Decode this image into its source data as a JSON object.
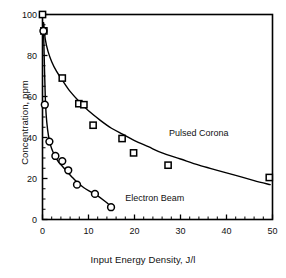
{
  "chart_data": {
    "type": "scatter",
    "title": "",
    "xlabel": "Input Energy Density, J/l",
    "ylabel": "Concentration, ppm",
    "xlim": [
      0,
      50
    ],
    "ylim": [
      0,
      100
    ],
    "xticks": [
      0,
      10,
      20,
      30,
      40,
      50
    ],
    "yticks": [
      0,
      20,
      40,
      60,
      80,
      100
    ],
    "xtick_labels": [
      "0",
      "10",
      "20",
      "30",
      "40",
      "50"
    ],
    "ytick_labels": [
      "0",
      "20",
      "40",
      "60",
      "80",
      "100"
    ],
    "minor_ticks": true,
    "grid": false,
    "legend": "inline-annotations",
    "frame": "box",
    "series": [
      {
        "name": "Pulsed Corona",
        "marker": "open-square",
        "label_x": 27.5,
        "label_y": 41.5,
        "points": [
          {
            "x": 0.0,
            "y": 100.0
          },
          {
            "x": 0.3,
            "y": 92.0
          },
          {
            "x": 4.3,
            "y": 69.0
          },
          {
            "x": 7.9,
            "y": 56.5
          },
          {
            "x": 9.0,
            "y": 56.0
          },
          {
            "x": 11.0,
            "y": 46.0
          },
          {
            "x": 17.3,
            "y": 39.5
          },
          {
            "x": 19.8,
            "y": 32.5
          },
          {
            "x": 27.3,
            "y": 26.5
          },
          {
            "x": 49.3,
            "y": 20.5
          }
        ],
        "curve": [
          {
            "x": 0.25,
            "y": 96.0
          },
          {
            "x": 0.6,
            "y": 88.0
          },
          {
            "x": 1.2,
            "y": 82.0
          },
          {
            "x": 2.0,
            "y": 77.0
          },
          {
            "x": 3.0,
            "y": 72.5
          },
          {
            "x": 4.3,
            "y": 68.0
          },
          {
            "x": 6.0,
            "y": 62.5
          },
          {
            "x": 8.0,
            "y": 57.5
          },
          {
            "x": 10.0,
            "y": 53.0
          },
          {
            "x": 12.5,
            "y": 48.5
          },
          {
            "x": 15.0,
            "y": 44.5
          },
          {
            "x": 17.5,
            "y": 41.5
          },
          {
            "x": 20.0,
            "y": 38.5
          },
          {
            "x": 23.0,
            "y": 35.5
          },
          {
            "x": 26.0,
            "y": 32.5
          },
          {
            "x": 30.0,
            "y": 29.5
          },
          {
            "x": 34.0,
            "y": 26.5
          },
          {
            "x": 38.0,
            "y": 24.0
          },
          {
            "x": 42.0,
            "y": 21.5
          },
          {
            "x": 46.0,
            "y": 19.0
          },
          {
            "x": 49.5,
            "y": 17.0
          }
        ]
      },
      {
        "name": "Electron Beam",
        "marker": "open-circle",
        "label_x": 18.0,
        "label_y": 10.0,
        "points": [
          {
            "x": 0.2,
            "y": 92.0
          },
          {
            "x": 0.5,
            "y": 56.0
          },
          {
            "x": 1.5,
            "y": 38.0
          },
          {
            "x": 2.8,
            "y": 31.0
          },
          {
            "x": 4.3,
            "y": 28.5
          },
          {
            "x": 5.6,
            "y": 24.0
          },
          {
            "x": 7.5,
            "y": 17.0
          },
          {
            "x": 11.4,
            "y": 12.5
          },
          {
            "x": 14.9,
            "y": 6.0
          }
        ],
        "curve": [
          {
            "x": 0.15,
            "y": 96.0
          },
          {
            "x": 0.3,
            "y": 86.0
          },
          {
            "x": 0.45,
            "y": 72.0
          },
          {
            "x": 0.6,
            "y": 60.0
          },
          {
            "x": 0.8,
            "y": 51.0
          },
          {
            "x": 1.1,
            "y": 44.0
          },
          {
            "x": 1.5,
            "y": 38.5
          },
          {
            "x": 2.0,
            "y": 34.5
          },
          {
            "x": 2.7,
            "y": 31.0
          },
          {
            "x": 3.5,
            "y": 28.0
          },
          {
            "x": 4.5,
            "y": 25.5
          },
          {
            "x": 5.5,
            "y": 23.0
          },
          {
            "x": 6.5,
            "y": 20.5
          },
          {
            "x": 7.6,
            "y": 18.0
          },
          {
            "x": 9.0,
            "y": 15.5
          },
          {
            "x": 10.5,
            "y": 13.5
          },
          {
            "x": 12.0,
            "y": 11.5
          },
          {
            "x": 13.5,
            "y": 9.0
          },
          {
            "x": 15.0,
            "y": 6.2
          }
        ]
      }
    ]
  }
}
